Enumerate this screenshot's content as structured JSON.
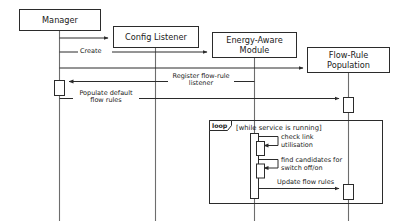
{
  "diagram": {
    "type": "uml-sequence-diagram",
    "colors": {
      "stroke": "#2b2b2b",
      "lifeline": "#6d6d6d",
      "background": "#ffffff",
      "text": "#1a1a1a"
    },
    "participants": [
      {
        "id": "manager",
        "label": "Manager",
        "lines": [
          "Manager"
        ]
      },
      {
        "id": "config-listener",
        "label": "Config Listener",
        "lines": [
          "Config Listener"
        ]
      },
      {
        "id": "energy-aware-module",
        "label": "Energy-Aware Module",
        "lines": [
          "Energy-Aware",
          "Module"
        ]
      },
      {
        "id": "flow-rule-population",
        "label": "Flow-Rule Population",
        "lines": [
          "Flow-Rule",
          "Population"
        ]
      }
    ],
    "messages": [
      {
        "id": "m1",
        "label": "",
        "from": "manager",
        "to": "config-listener",
        "kind": "create"
      },
      {
        "id": "m2",
        "label": "Create",
        "from": "manager",
        "to": "energy-aware-module",
        "kind": "create"
      },
      {
        "id": "m3",
        "label": "",
        "from": "manager",
        "to": "flow-rule-population",
        "kind": "create"
      },
      {
        "id": "m4",
        "label": "Register flow-rule listener",
        "lines": [
          "Register flow-rule",
          "listener"
        ],
        "from": "energy-aware-module",
        "to": "manager",
        "kind": "call"
      },
      {
        "id": "m5",
        "label": "Populate default flow rules",
        "lines": [
          "Populate default",
          "flow rules"
        ],
        "from": "manager",
        "to": "flow-rule-population",
        "kind": "call"
      },
      {
        "id": "m6",
        "label": "check link utilisation",
        "lines": [
          "check link",
          "utilisation"
        ],
        "from": "energy-aware-module",
        "to": "energy-aware-module",
        "kind": "self"
      },
      {
        "id": "m7",
        "label": "find candidates for switch off/on",
        "lines": [
          "find candidates for",
          "switch off/on"
        ],
        "from": "energy-aware-module",
        "to": "energy-aware-module",
        "kind": "self"
      },
      {
        "id": "m8",
        "label": "Update flow rules",
        "lines": [
          "Update flow rules"
        ],
        "from": "energy-aware-module",
        "to": "flow-rule-population",
        "kind": "call"
      }
    ],
    "fragment": {
      "operator": "loop",
      "guard": "[while service is running]"
    }
  }
}
